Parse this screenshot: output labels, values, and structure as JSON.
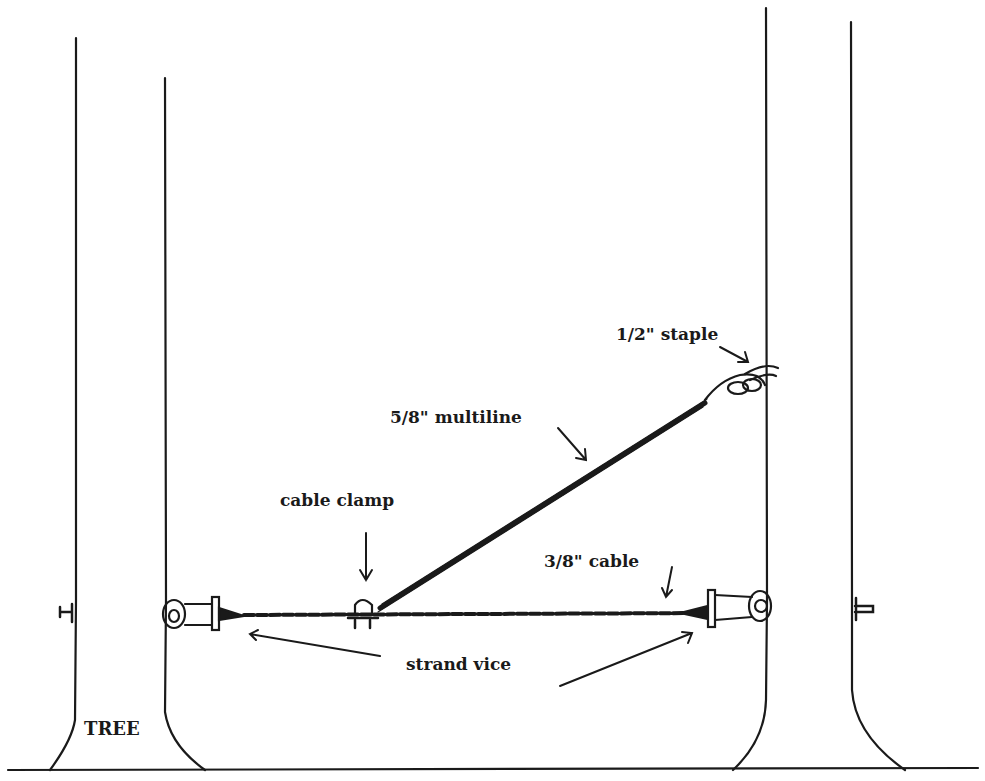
{
  "diagram": {
    "type": "rigging-illustration",
    "labels": {
      "staple": "1/2\" staple",
      "multiline": "5/8\" multiline",
      "cable_clamp": "cable clamp",
      "cable": "3/8\" cable",
      "strand_vice": "strand vice",
      "tree": "TREE"
    },
    "elements": {
      "trees": 2,
      "ground_line": true,
      "horizontal_cable": "3/8\" cable between trees with strand vices at both ends",
      "diagonal_rope": "5/8\" multiline from cable clamp up to 1/2\" staple on right tree"
    },
    "colors": {
      "ink": "#1a1a1a",
      "background": "#ffffff"
    }
  }
}
